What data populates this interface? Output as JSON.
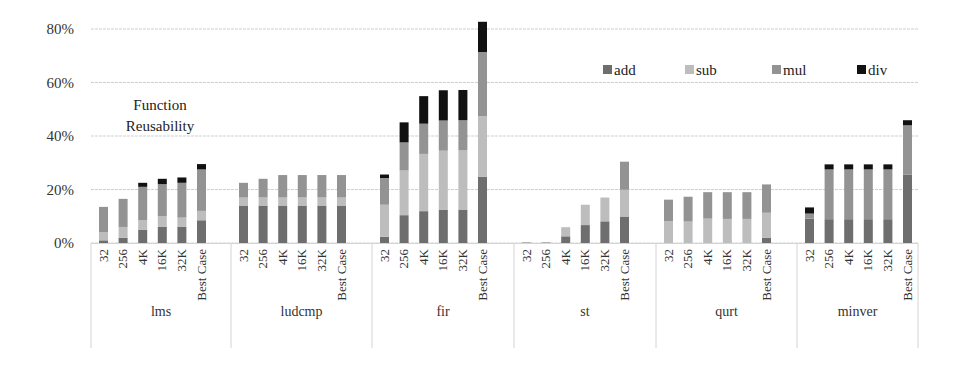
{
  "chart_data": {
    "type": "bar",
    "stacked": true,
    "title": "",
    "annotation": [
      "Function",
      "Reusability"
    ],
    "xlabel": "",
    "ylabel": "",
    "ylim": [
      0,
      80
    ],
    "yticks": [
      "0%",
      "20%",
      "40%",
      "60%",
      "80%"
    ],
    "ytick_values": [
      0,
      20,
      40,
      60,
      80
    ],
    "grid": true,
    "legend_position": "upper right",
    "groups": [
      "lms",
      "ludcmp",
      "fir",
      "st",
      "qurt",
      "minver"
    ],
    "categories": [
      "32",
      "256",
      "4K",
      "16K",
      "32K",
      "Best Case"
    ],
    "series": [
      {
        "name": "add",
        "color": "#6e6e6e",
        "values": {
          "lms": [
            1.0,
            2.0,
            5.0,
            6.0,
            6.0,
            8.5
          ],
          "ludcmp": [
            14.0,
            14.0,
            14.0,
            14.0,
            14.0,
            14.0
          ],
          "fir": [
            2.3,
            10.4,
            11.9,
            12.5,
            12.5,
            24.8
          ],
          "st": [
            0.2,
            0.2,
            2.5,
            6.7,
            8.1,
            9.9
          ],
          "qurt": [
            0.0,
            0.0,
            0.0,
            0.0,
            0.0,
            1.9
          ],
          "minver": [
            9.1,
            8.9,
            8.9,
            8.9,
            8.9,
            25.6
          ]
        }
      },
      {
        "name": "sub",
        "color": "#bdbdbd",
        "values": {
          "lms": [
            3.0,
            4.0,
            3.5,
            4.0,
            3.5,
            3.5
          ],
          "ludcmp": [
            3.0,
            3.0,
            3.0,
            3.0,
            3.0,
            3.0
          ],
          "fir": [
            12.0,
            16.7,
            21.4,
            22.0,
            22.1,
            22.6
          ],
          "st": [
            0.1,
            0.1,
            3.4,
            7.6,
            8.9,
            10.0
          ],
          "qurt": [
            8.1,
            8.0,
            9.1,
            9.0,
            9.0,
            9.4
          ],
          "minver": [
            0.0,
            0.0,
            0.0,
            0.0,
            0.0,
            0.0
          ]
        }
      },
      {
        "name": "mul",
        "color": "#939393",
        "values": {
          "lms": [
            9.5,
            10.5,
            12.5,
            12.0,
            13.0,
            15.5
          ],
          "ludcmp": [
            5.5,
            7.0,
            8.4,
            8.4,
            8.4,
            8.4
          ],
          "fir": [
            10.0,
            10.5,
            11.3,
            11.3,
            11.3,
            24.0
          ],
          "st": [
            0.0,
            0.0,
            0.0,
            0.0,
            0.0,
            10.5
          ],
          "qurt": [
            8.1,
            9.3,
            9.9,
            10.0,
            10.0,
            10.6
          ],
          "minver": [
            1.9,
            18.6,
            18.6,
            18.6,
            18.6,
            18.4
          ]
        }
      },
      {
        "name": "div",
        "color": "#111111",
        "values": {
          "lms": [
            0.0,
            0.0,
            1.5,
            2.0,
            2.0,
            2.0
          ],
          "ludcmp": [
            0.0,
            0.0,
            0.0,
            0.0,
            0.0,
            0.0
          ],
          "fir": [
            1.3,
            7.5,
            10.3,
            11.3,
            11.3,
            11.3
          ],
          "st": [
            0.0,
            0.0,
            0.0,
            0.0,
            0.0,
            0.0
          ],
          "qurt": [
            0.0,
            0.0,
            0.0,
            0.0,
            0.0,
            0.0
          ],
          "minver": [
            2.3,
            1.9,
            1.9,
            1.9,
            1.9,
            1.9
          ]
        }
      }
    ]
  },
  "legend": {
    "items": [
      {
        "label": "add",
        "color": "#6e6e6e"
      },
      {
        "label": "sub",
        "color": "#bdbdbd"
      },
      {
        "label": "mul",
        "color": "#939393"
      },
      {
        "label": "div",
        "color": "#111111"
      }
    ]
  }
}
